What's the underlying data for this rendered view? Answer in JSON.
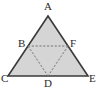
{
  "figure": {
    "kind": "geometry-diagram",
    "background_color": "#ffffff",
    "fill_color": "#d5d5d5",
    "outline_color": "#3a3a3a",
    "dashed_color": "#777777",
    "label_color": "#2a2a2a",
    "outer_triangle": {
      "name": "triangle-ACE",
      "vertices": [
        "A",
        "C",
        "E"
      ],
      "points": "48,16 8,76 88,76"
    },
    "inner_triangle": {
      "name": "triangle-BFD",
      "vertices": [
        "B",
        "F",
        "D"
      ],
      "points": "28,46 68,46 48,76"
    },
    "segments": [
      {
        "name": "segment-BF",
        "from": "B",
        "to": "F",
        "x1": 28,
        "y1": 46,
        "x2": 68,
        "y2": 46,
        "style": "dashed"
      },
      {
        "name": "segment-BD",
        "from": "B",
        "to": "D",
        "x1": 28,
        "y1": 46,
        "x2": 48,
        "y2": 76,
        "style": "dashed"
      },
      {
        "name": "segment-FD",
        "from": "F",
        "to": "D",
        "x1": 68,
        "y1": 46,
        "x2": 48,
        "y2": 76,
        "style": "dashed"
      }
    ],
    "labels": [
      {
        "name": "vertex-label-A",
        "text": "A",
        "left": 44,
        "top": 1
      },
      {
        "name": "vertex-label-B",
        "text": "B",
        "left": 18,
        "top": 38
      },
      {
        "name": "vertex-label-F",
        "text": "F",
        "left": 70,
        "top": 38
      },
      {
        "name": "vertex-label-C",
        "text": "C",
        "left": 1,
        "top": 73
      },
      {
        "name": "vertex-label-D",
        "text": "D",
        "left": 44,
        "top": 78
      },
      {
        "name": "vertex-label-E",
        "text": "E",
        "left": 89,
        "top": 73
      }
    ]
  }
}
